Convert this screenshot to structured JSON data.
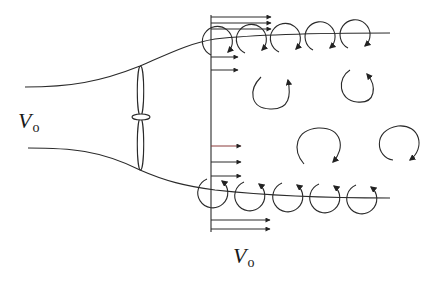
{
  "diagram": {
    "title": "",
    "type": "wind turbine wake vortex schematic",
    "labels": {
      "upstream_velocity": {
        "main": "V",
        "sub": "o"
      },
      "wake_velocity": {
        "main": "V",
        "sub": "o"
      }
    },
    "elements": {
      "rotor": {
        "description": "two-bladed rotor with hub",
        "x": 141,
        "blade_top_y": 65,
        "blade_bottom_y": 170,
        "hub_y": 117
      },
      "streamtube": {
        "upper": [
          [
            25,
            87
          ],
          [
            90,
            85
          ],
          [
            140,
            66
          ],
          [
            210,
            40
          ],
          [
            300,
            35
          ],
          [
            390,
            33
          ]
        ],
        "lower": [
          [
            28,
            148
          ],
          [
            90,
            150
          ],
          [
            140,
            170
          ],
          [
            210,
            188
          ],
          [
            300,
            197
          ],
          [
            390,
            198
          ]
        ]
      },
      "wake_plane_x": 211,
      "velocity_profile_arrows": {
        "top": [
          {
            "y": 18,
            "len": 60
          },
          {
            "y": 23,
            "len": 60
          },
          {
            "y": 28,
            "len": 60
          },
          {
            "y": 57,
            "len": 38
          },
          {
            "y": 70,
            "len": 38
          }
        ],
        "bottom": [
          {
            "y": 146,
            "len": 30
          },
          {
            "y": 162,
            "len": 30
          },
          {
            "y": 175,
            "len": 30
          },
          {
            "y": 220,
            "len": 60
          },
          {
            "y": 229,
            "len": 60
          }
        ]
      },
      "tip_vortices_top": [
        [
          218,
          40
        ],
        [
          252,
          38
        ],
        [
          286,
          37
        ],
        [
          320,
          36
        ],
        [
          355,
          35
        ]
      ],
      "tip_vortices_bottom": [
        [
          213,
          193
        ],
        [
          250,
          196
        ],
        [
          288,
          197
        ],
        [
          325,
          198
        ],
        [
          362,
          199
        ]
      ],
      "wake_eddies": [
        {
          "cx": 269,
          "cy": 88,
          "r": 20,
          "dir": "ccw"
        },
        {
          "cx": 358,
          "cy": 85,
          "r": 17,
          "dir": "cw"
        },
        {
          "cx": 320,
          "cy": 160,
          "r": 25,
          "dir": "cw"
        },
        {
          "cx": 399,
          "cy": 155,
          "r": 24,
          "dir": "cw"
        }
      ]
    },
    "colors": {
      "line": "#2a2a2a",
      "background": "#ffffff",
      "accent_arrow": "#8a3a3a"
    }
  }
}
